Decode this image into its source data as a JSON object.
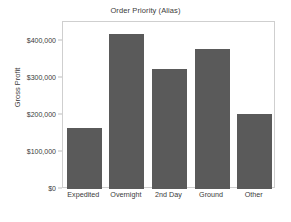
{
  "chart_data": {
    "type": "bar",
    "title": "Order Priority (Alias)",
    "xlabel": "",
    "ylabel": "Gross Profit",
    "categories": [
      "Expedited",
      "Overnight",
      "2nd Day",
      "Ground",
      "Other"
    ],
    "values": [
      165000,
      419000,
      323000,
      376000,
      203000
    ],
    "ylim": [
      0,
      450000
    ],
    "yticks": [
      0,
      100000,
      200000,
      300000,
      400000
    ],
    "ytick_labels": [
      "$0",
      "$100,000",
      "$200,000",
      "$300,000",
      "$400,000"
    ],
    "grid": false,
    "legend": false,
    "bar_color": "#5a5a5a",
    "frame_color": "#cfcfcf",
    "background_color": "#ffffff",
    "text_color": "#3a3a3a"
  }
}
